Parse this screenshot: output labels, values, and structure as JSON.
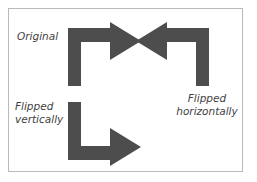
{
  "figure": {
    "background_color": "#ffffff",
    "border_color": "#b9b9b9",
    "shape_color": "#4d4d4d",
    "text_color": "#3f3f3f"
  },
  "labels": {
    "original": "Original",
    "flipped_vertically": "Flipped\nvertically",
    "flipped_horizontally": "Flipped\nhorizontally"
  },
  "shapes": [
    {
      "name": "arrow-original",
      "description": "Bent arrow: vertical shaft rising from bottom-left, turning right, arrowhead pointing right",
      "transform": "none",
      "color": "#4d4d4d",
      "points": "68,86 68,28 110,28 110,22 141,41 110,60 110,42 81,42 81,86"
    },
    {
      "name": "arrow-flipped-horizontally",
      "description": "Mirror image of original across vertical axis: arrowhead pointing left, shaft turning right then down",
      "transform": "flip-horizontal",
      "color": "#4d4d4d",
      "points": "209,86 209,28 167,28 167,22 136,41 167,60 167,42 196,42 196,86"
    },
    {
      "name": "arrow-flipped-vertically",
      "description": "Mirror image of original across horizontal axis: shaft descending from top-left, turning right at bottom, arrowhead pointing right",
      "transform": "flip-vertical",
      "color": "#4d4d4d",
      "points": "68,102 68,160 110,160 110,166 141,147 110,128 110,146 81,146 81,102"
    }
  ]
}
